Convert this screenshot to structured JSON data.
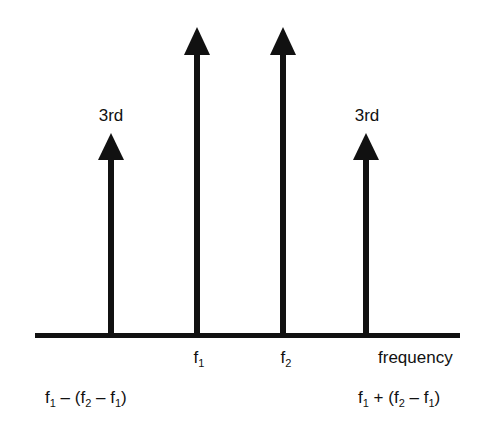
{
  "figure": {
    "title": "",
    "axis": {
      "label": "frequency",
      "x_start": 35,
      "x_end": 460,
      "y": 335,
      "thickness": 5
    },
    "colors": {
      "ink": "#111111",
      "background": "#ffffff"
    },
    "arrows": [
      {
        "id": "im3-lower",
        "x": 111,
        "tip_y": 133,
        "label_top": "3rd",
        "kind": "third-order intermod"
      },
      {
        "id": "f1",
        "x": 197,
        "tip_y": 27,
        "label_top": "",
        "kind": "fundamental"
      },
      {
        "id": "f2",
        "x": 283,
        "tip_y": 27,
        "label_top": "",
        "kind": "fundamental"
      },
      {
        "id": "im3-upper",
        "x": 366,
        "tip_y": 133,
        "label_top": "3rd",
        "kind": "third-order intermod"
      }
    ],
    "labels": {
      "third_left": "3rd",
      "third_right": "3rd",
      "f1": {
        "base": "f",
        "sub": "1"
      },
      "f2": {
        "base": "f",
        "sub": "2"
      },
      "frequency": "frequency",
      "lower_formula": {
        "p1": "f",
        "s1": "1",
        "p2": " – (f",
        "s2": "2",
        "p3": " – f",
        "s3": "1",
        "p4": ")"
      },
      "upper_formula": {
        "p1": "f",
        "s1": "1",
        "p2": " + (f",
        "s2": "2",
        "p3": " – f",
        "s3": "1",
        "p4": ")"
      }
    }
  }
}
